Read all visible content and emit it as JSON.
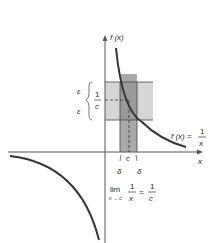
{
  "diagram": {
    "axis_labels": {
      "y": "f (x)",
      "x": "x"
    },
    "function_label": {
      "lhs": "f (x) =",
      "numerator": "1",
      "denominator": "x"
    },
    "epsilon_labels": {
      "upper": "ε",
      "lower": "ε"
    },
    "y_value_label": {
      "numerator": "1",
      "denominator": "c"
    },
    "x_ticks": {
      "c": "c",
      "delta_left": "δ",
      "delta_right": "δ"
    },
    "limit_expression": {
      "lim": "lim",
      "subscript": "x → c",
      "lhs_numerator": "1",
      "lhs_denominator": "x",
      "equals": "=",
      "rhs_numerator": "1",
      "rhs_denominator": "c"
    },
    "colors": {
      "epsilon_band": "#d6d6d6",
      "delta_band": "#a9a9a9",
      "overlap": "#9a9a9a",
      "curve": "#333333",
      "axes": "#555555"
    }
  }
}
